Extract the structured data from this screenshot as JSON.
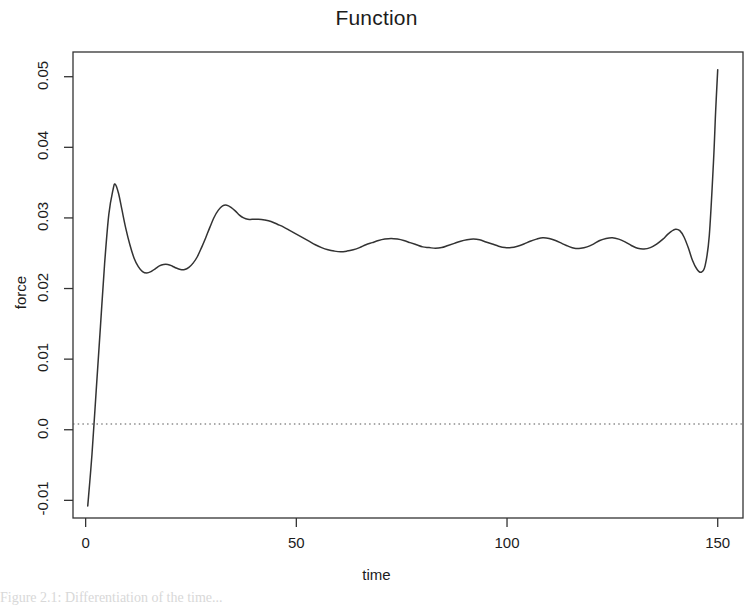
{
  "figure": {
    "title": "Function",
    "caption_fragment": "Figure 2.1: Differentiation of the time...",
    "background_color": "#ffffff",
    "line_color": "#333333",
    "axis_color": "#333333",
    "reference_line_color": "#555555"
  },
  "chart_data": {
    "type": "line",
    "title": "Function",
    "xlabel": "time",
    "ylabel": "force",
    "xlim": [
      -3,
      156
    ],
    "ylim": [
      -0.0125,
      0.0535
    ],
    "xticks": [
      0,
      50,
      100,
      150
    ],
    "xtick_labels": [
      "0",
      "50",
      "100",
      "150"
    ],
    "yticks": [
      -0.01,
      0.0,
      0.01,
      0.02,
      0.03,
      0.04,
      0.05
    ],
    "ytick_labels": [
      "-0.01",
      "0.0",
      "0.01",
      "0.02",
      "0.03",
      "0.04",
      "0.05"
    ],
    "grid": false,
    "legend": null,
    "reference_lines": [
      {
        "orientation": "horizontal",
        "value": 0.0,
        "style": "dotted"
      }
    ],
    "series": [
      {
        "name": "force",
        "style": "solid",
        "x": [
          0.5,
          1.5,
          2.5,
          3.5,
          4.5,
          5.5,
          6.5,
          7.0,
          7.8,
          8.6,
          9.5,
          10.5,
          11.5,
          12.5,
          13.5,
          14.5,
          15.5,
          16.5,
          17.5,
          18.5,
          19.5,
          20.5,
          21.5,
          22.5,
          23.5,
          24.5,
          25.5,
          26.5,
          27.5,
          28.5,
          29.5,
          30.5,
          31.5,
          32.5,
          33.5,
          34.5,
          35.5,
          36.5,
          37.5,
          38.5,
          39.5,
          41.0,
          42.5,
          44.0,
          45.5,
          47.0,
          48.5,
          50.0,
          51.5,
          53.0,
          54.5,
          56.0,
          57.5,
          59.0,
          60.5,
          62.0,
          63.5,
          65.0,
          66.5,
          68.0,
          69.5,
          71.0,
          72.5,
          74.0,
          75.5,
          77.0,
          78.5,
          80.0,
          81.5,
          83.0,
          84.5,
          86.0,
          87.5,
          89.0,
          90.5,
          92.0,
          93.5,
          95.0,
          96.5,
          98.0,
          99.5,
          101.0,
          102.5,
          104.0,
          105.5,
          107.0,
          108.5,
          110.0,
          111.5,
          113.0,
          114.5,
          116.0,
          117.5,
          119.0,
          120.5,
          122.0,
          123.5,
          125.0,
          126.5,
          128.0,
          129.5,
          131.0,
          132.5,
          134.0,
          135.5,
          137.0,
          138.0,
          139.0,
          140.0,
          141.0,
          142.0,
          143.0,
          144.0,
          145.0,
          146.0,
          147.0,
          148.0,
          149.0,
          149.5,
          150.0
        ],
        "y": [
          -0.0108,
          -0.0035,
          0.0055,
          0.0145,
          0.0235,
          0.0305,
          0.034,
          0.0348,
          0.0335,
          0.0312,
          0.0286,
          0.0262,
          0.0243,
          0.0231,
          0.0224,
          0.0222,
          0.0224,
          0.0228,
          0.0232,
          0.0234,
          0.0234,
          0.0232,
          0.0229,
          0.0227,
          0.0227,
          0.023,
          0.0236,
          0.0245,
          0.0258,
          0.0272,
          0.0287,
          0.0301,
          0.0311,
          0.0317,
          0.0318,
          0.0315,
          0.031,
          0.0304,
          0.03,
          0.0298,
          0.0298,
          0.0298,
          0.0297,
          0.0295,
          0.0291,
          0.0287,
          0.0282,
          0.0277,
          0.0272,
          0.0267,
          0.0262,
          0.0258,
          0.0255,
          0.0253,
          0.0252,
          0.0253,
          0.0255,
          0.0258,
          0.0262,
          0.0265,
          0.0268,
          0.027,
          0.0271,
          0.027,
          0.0268,
          0.0265,
          0.0262,
          0.0259,
          0.0258,
          0.0257,
          0.0258,
          0.0261,
          0.0264,
          0.0267,
          0.0269,
          0.027,
          0.0269,
          0.0266,
          0.0263,
          0.026,
          0.0258,
          0.0258,
          0.026,
          0.0263,
          0.0267,
          0.027,
          0.0272,
          0.0271,
          0.0268,
          0.0264,
          0.026,
          0.0257,
          0.0257,
          0.0259,
          0.0263,
          0.0268,
          0.0271,
          0.0272,
          0.027,
          0.0266,
          0.0261,
          0.0257,
          0.0256,
          0.0258,
          0.0263,
          0.027,
          0.0276,
          0.0281,
          0.0284,
          0.0282,
          0.0273,
          0.0258,
          0.024,
          0.0228,
          0.0223,
          0.0232,
          0.0275,
          0.038,
          0.045,
          0.051
        ]
      }
    ]
  },
  "geometry": {
    "plot_left": 73,
    "plot_right": 743,
    "plot_top": 52,
    "plot_bottom": 518
  }
}
